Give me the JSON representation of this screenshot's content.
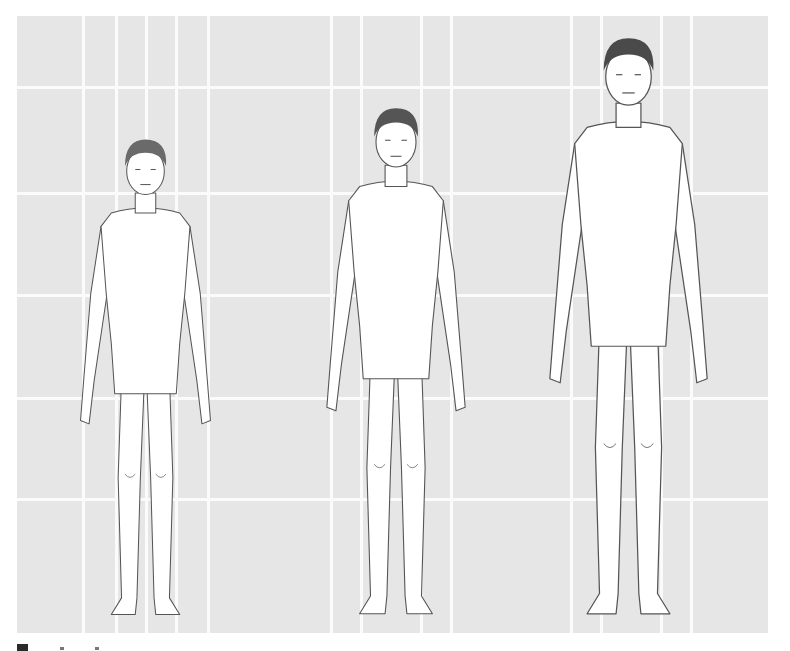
{
  "figure": {
    "type": "anatomical-illustration",
    "background": {
      "color": "#e6e6e6",
      "grid_line_color": "#fbfbfb",
      "vertical_lines_x": [
        82,
        115,
        145,
        175,
        207,
        330,
        360,
        420,
        450,
        570,
        600,
        660,
        690
      ],
      "horizontal_lines_y": [
        86,
        192,
        294,
        397,
        498
      ]
    },
    "figures": [
      {
        "label": "figure-small",
        "left": 60,
        "top": 126,
        "height": 502,
        "hair_color": "#6a6a6a",
        "stroke": "#555555"
      },
      {
        "label": "figure-medium",
        "left": 305,
        "top": 94,
        "height": 534,
        "hair_color": "#555555",
        "stroke": "#555555"
      },
      {
        "label": "figure-tall",
        "left": 525,
        "top": 22,
        "height": 608,
        "hair_color": "#4a4a4a",
        "stroke": "#555555"
      }
    ]
  }
}
